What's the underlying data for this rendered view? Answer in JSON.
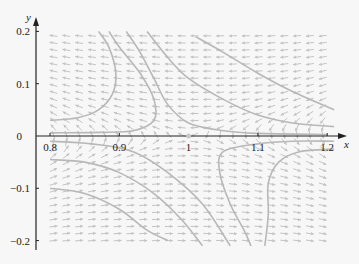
{
  "chart_data": {
    "type": "phase_portrait",
    "title": "",
    "xlabel": "x",
    "ylabel": "y",
    "xlim": [
      0.78,
      1.22
    ],
    "ylim": [
      -0.21,
      0.21
    ],
    "x_ticks": [
      "0.8",
      "0.9",
      "1",
      "1.1",
      "1.2"
    ],
    "y_ticks": [
      "0.2",
      "0.1",
      "0",
      "-0.1",
      "-0.2"
    ],
    "equilibrium": {
      "x": 1,
      "y": 0,
      "type": "saddle"
    },
    "grid": false,
    "legend": null,
    "trajectories": [
      [
        [
          0.8,
          0.03
        ],
        [
          0.84,
          0.035
        ],
        [
          0.87,
          0.05
        ],
        [
          0.89,
          0.08
        ],
        [
          0.895,
          0.12
        ],
        [
          0.885,
          0.17
        ],
        [
          0.87,
          0.2
        ]
      ],
      [
        [
          0.8,
          0.006
        ],
        [
          0.87,
          0.007
        ],
        [
          0.92,
          0.01
        ],
        [
          0.95,
          0.03
        ],
        [
          0.95,
          0.07
        ],
        [
          0.93,
          0.12
        ],
        [
          0.9,
          0.17
        ],
        [
          0.885,
          0.2
        ]
      ],
      [
        [
          0.91,
          0.2
        ],
        [
          0.93,
          0.16
        ],
        [
          0.95,
          0.11
        ],
        [
          0.97,
          0.06
        ],
        [
          1.0,
          0.025
        ],
        [
          1.05,
          0.01
        ],
        [
          1.1,
          0.005
        ],
        [
          1.2,
          0.003
        ]
      ],
      [
        [
          0.94,
          0.2
        ],
        [
          0.97,
          0.15
        ],
        [
          1.0,
          0.11
        ],
        [
          1.05,
          0.07
        ],
        [
          1.1,
          0.04
        ],
        [
          1.15,
          0.025
        ],
        [
          1.21,
          0.018
        ]
      ],
      [
        [
          1.01,
          0.19
        ],
        [
          1.05,
          0.16
        ],
        [
          1.1,
          0.12
        ],
        [
          1.15,
          0.085
        ],
        [
          1.21,
          0.05
        ]
      ],
      [
        [
          0.8,
          -0.01
        ],
        [
          0.86,
          -0.015
        ],
        [
          0.92,
          -0.03
        ],
        [
          0.97,
          -0.07
        ],
        [
          1.02,
          -0.13
        ],
        [
          1.06,
          -0.21
        ]
      ],
      [
        [
          0.8,
          -0.045
        ],
        [
          0.85,
          -0.05
        ],
        [
          0.9,
          -0.07
        ],
        [
          0.95,
          -0.11
        ],
        [
          0.99,
          -0.16
        ],
        [
          1.02,
          -0.21
        ]
      ],
      [
        [
          0.8,
          -0.1
        ],
        [
          0.85,
          -0.11
        ],
        [
          0.9,
          -0.14
        ],
        [
          0.94,
          -0.18
        ],
        [
          0.97,
          -0.2
        ]
      ],
      [
        [
          1.21,
          -0.01
        ],
        [
          1.15,
          -0.01
        ],
        [
          1.1,
          -0.015
        ],
        [
          1.05,
          -0.03
        ],
        [
          1.045,
          -0.07
        ],
        [
          1.06,
          -0.13
        ],
        [
          1.08,
          -0.18
        ],
        [
          1.09,
          -0.21
        ]
      ],
      [
        [
          1.21,
          -0.025
        ],
        [
          1.16,
          -0.03
        ],
        [
          1.13,
          -0.05
        ],
        [
          1.115,
          -0.09
        ],
        [
          1.115,
          -0.15
        ],
        [
          1.11,
          -0.21
        ]
      ]
    ],
    "field_description": "Saddle at (1,0): flow leftward above the x-axis, rightward below; upward/rightward drift at upper-left, downward at lower-right."
  },
  "colors": {
    "background": "#f7f7f7",
    "axis": "#222222",
    "trajectory": "#b8b8b8",
    "arrow": "#c4c4c4",
    "equilibrium": "#c8c8c8"
  }
}
